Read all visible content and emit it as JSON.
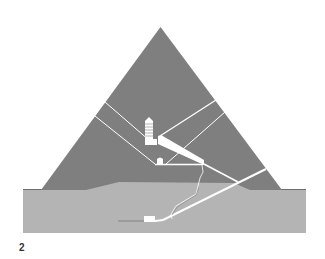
{
  "figure": {
    "number_label": "2",
    "colors": {
      "background": "#ffffff",
      "pyramid": "#7f7f7f",
      "ground": "#b4b4b4",
      "passages": "#ffffff",
      "edge": "#555555"
    },
    "elements": [
      "pyramid-body",
      "bedrock-ground",
      "king-chamber",
      "relieving-chambers",
      "grand-gallery",
      "queen-chamber",
      "descending-passage",
      "ascending-passage",
      "subterranean-chamber",
      "air-shafts",
      "well-shaft"
    ]
  }
}
